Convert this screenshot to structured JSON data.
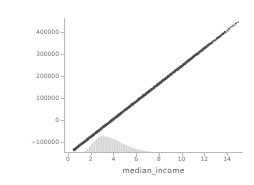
{
  "chart_data": {
    "type": "scatter",
    "title": "",
    "xlabel": "median_income",
    "ylabel": "SHAP value for\nmedian_income",
    "ylabel_line1": "SHAP value for",
    "ylabel_line2": "median_income",
    "xlim": [
      -0.35,
      15.4
    ],
    "ylim": [
      -148000,
      462000
    ],
    "xticks": [
      0,
      2,
      4,
      6,
      8,
      10,
      12,
      14
    ],
    "xticklabels": [
      "0",
      "2",
      "4",
      "6",
      "8",
      "10",
      "12",
      "14"
    ],
    "yticks": [
      -100000,
      0,
      100000,
      200000,
      300000,
      400000
    ],
    "yticklabels": [
      "−100000",
      "0",
      "100000",
      "200000",
      "300000",
      "400000"
    ],
    "grid": false,
    "legend": null,
    "point_color": "#4d4d4d",
    "point_alpha": 0.85,
    "point_size": 1.3,
    "histogram_color": "#d6d6d6",
    "axis_color": "#b8b8b8",
    "tick_label_color": "#6e6e6e",
    "axis_label_color": "#5a5a5a",
    "series": [
      {
        "name": "SHAP value for median_income",
        "description": "Near-linear dense band of points rising from lower-left to upper-right",
        "x": [
          0.5,
          0.7,
          0.9,
          1.1,
          1.3,
          1.5,
          1.7,
          1.9,
          2.1,
          2.3,
          2.5,
          2.7,
          2.9,
          3.1,
          3.3,
          3.5,
          3.7,
          3.9,
          4.1,
          4.3,
          4.5,
          4.7,
          4.9,
          5.1,
          5.3,
          5.5,
          5.7,
          5.9,
          6.1,
          6.3,
          6.5,
          6.7,
          6.9,
          7.1,
          7.3,
          7.5,
          7.7,
          7.9,
          8.1,
          8.3,
          8.5,
          8.7,
          8.9,
          9.1,
          9.3,
          9.5,
          9.7,
          9.9,
          10.1,
          10.3,
          10.5,
          10.7,
          10.9,
          11.1,
          11.3,
          11.5,
          11.7,
          11.9,
          12.1,
          12.3,
          12.5,
          12.7,
          12.9,
          13.1,
          13.3,
          13.5,
          13.7,
          13.9,
          14.1,
          14.3,
          14.55,
          14.8,
          15.0
        ],
        "y": [
          -135000,
          -127000,
          -119000,
          -111000,
          -103000,
          -95000,
          -87000,
          -79000,
          -71000,
          -63000,
          -55000,
          -47000,
          -39000,
          -31000,
          -23000,
          -15000,
          -7000,
          1000,
          9000,
          17000,
          25000,
          33000,
          41000,
          49000,
          57000,
          65000,
          73000,
          81000,
          89000,
          97000,
          105000,
          113000,
          121000,
          129000,
          137000,
          145000,
          153000,
          161000,
          169000,
          177000,
          185000,
          193000,
          201000,
          209000,
          217000,
          225000,
          233000,
          241000,
          249000,
          257000,
          265000,
          273000,
          281000,
          289000,
          297000,
          305000,
          313000,
          321000,
          329000,
          337000,
          345000,
          353000,
          361000,
          369000,
          377000,
          385000,
          393000,
          401000,
          409000,
          417000,
          427000,
          437000,
          445000
        ],
        "x_range": [
          0.5,
          15.05
        ],
        "y_range": [
          -135000,
          447000
        ],
        "slope": 40000,
        "intercept": -155000
      }
    ],
    "histogram": {
      "name": "median_income distribution",
      "orientation": "vertical-bottom",
      "bin_centers": [
        1.35,
        1.55,
        1.75,
        1.95,
        2.15,
        2.35,
        2.55,
        2.75,
        2.95,
        3.15,
        3.35,
        3.55,
        3.75,
        3.95,
        4.15,
        4.35,
        4.55,
        4.75,
        4.95,
        5.15,
        5.35,
        5.55,
        5.75,
        5.95,
        6.15,
        6.35,
        6.55,
        6.75,
        6.95,
        7.15,
        7.35,
        7.55,
        7.75,
        7.95,
        8.15,
        8.35,
        8.55,
        8.75,
        8.95,
        9.15
      ],
      "counts": [
        0.06,
        0.13,
        0.24,
        0.4,
        0.56,
        0.7,
        0.82,
        0.92,
        1.0,
        0.98,
        0.95,
        0.93,
        0.88,
        0.84,
        0.8,
        0.74,
        0.66,
        0.58,
        0.52,
        0.46,
        0.4,
        0.35,
        0.3,
        0.26,
        0.22,
        0.19,
        0.16,
        0.13,
        0.11,
        0.09,
        0.075,
        0.06,
        0.05,
        0.04,
        0.032,
        0.026,
        0.02,
        0.015,
        0.011,
        0.007
      ],
      "peak_x": 2.95,
      "max_height_px": 17
    }
  }
}
